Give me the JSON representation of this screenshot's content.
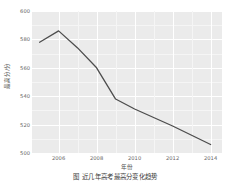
{
  "chart_data": {
    "type": "line",
    "title": "",
    "xlabel": "年份",
    "ylabel": "最高分/分",
    "xlim": [
      2004.6,
      2014.6
    ],
    "ylim": [
      500,
      600
    ],
    "grid": true,
    "legend": null,
    "x": [
      2005,
      2006,
      2007,
      2008,
      2009,
      2010,
      2012,
      2014
    ],
    "values": [
      578,
      586,
      574,
      560,
      538,
      531,
      519,
      506
    ],
    "series": [
      {
        "name": "最高分",
        "x": [
          2005,
          2006,
          2007,
          2008,
          2009,
          2010,
          2012,
          2014
        ],
        "values": [
          578,
          586,
          574,
          560,
          538,
          531,
          519,
          506
        ],
        "color": "#4d4d4d"
      }
    ],
    "x_ticks": [
      2006,
      2008,
      2010,
      2012,
      2014
    ],
    "x_tick_labels": [
      "2006",
      "2008",
      "2010",
      "2012",
      "2014"
    ],
    "y_ticks": [
      500,
      520,
      540,
      560,
      580,
      600
    ],
    "y_tick_labels": [
      "500",
      "520",
      "540",
      "560",
      "580",
      "600"
    ],
    "panel_background": "#ebebeb",
    "gridline_color": "#ffffff",
    "line_color": "#4d4d4d"
  },
  "caption": {
    "text": "图 近几年高考最高分变化趋势"
  }
}
